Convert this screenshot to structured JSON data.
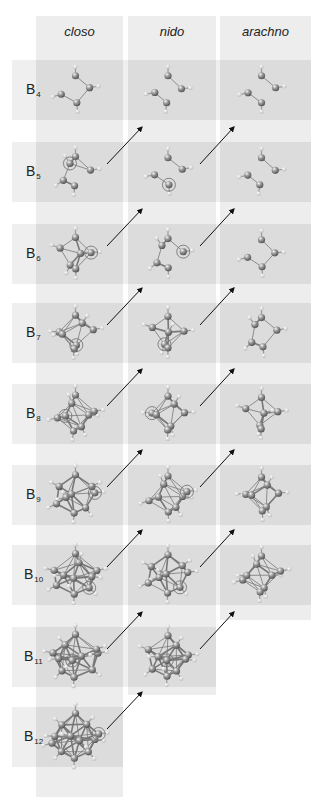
{
  "diagram": {
    "columns": [
      {
        "id": "closo",
        "label": "closo",
        "x": 36,
        "width": 87,
        "bottom": 797
      },
      {
        "id": "nido",
        "label": "nido",
        "x": 128,
        "width": 88,
        "bottom": 695
      },
      {
        "id": "arachno",
        "label": "arachno",
        "x": 220,
        "width": 91,
        "bottom": 620
      }
    ],
    "rows": [
      {
        "element": "B",
        "n": "4",
        "y": 60,
        "cells": [
          "closo",
          "nido",
          "arachno"
        ]
      },
      {
        "element": "B",
        "n": "5",
        "y": 142,
        "cells": [
          "closo",
          "nido",
          "arachno"
        ]
      },
      {
        "element": "B",
        "n": "6",
        "y": 224,
        "cells": [
          "closo",
          "nido",
          "arachno"
        ]
      },
      {
        "element": "B",
        "n": "7",
        "y": 303,
        "cells": [
          "closo",
          "nido",
          "arachno"
        ]
      },
      {
        "element": "B",
        "n": "8",
        "y": 384,
        "cells": [
          "closo",
          "nido",
          "arachno"
        ]
      },
      {
        "element": "B",
        "n": "9",
        "y": 465,
        "cells": [
          "closo",
          "nido",
          "arachno"
        ]
      },
      {
        "element": "B",
        "n": "10",
        "y": 545,
        "cells": [
          "closo",
          "nido",
          "arachno"
        ]
      },
      {
        "element": "B",
        "n": "11",
        "y": 627,
        "cells": [
          "closo",
          "nido"
        ]
      },
      {
        "element": "B",
        "n": "12",
        "y": 707,
        "cells": [
          "closo"
        ]
      }
    ],
    "arrows_description": "Diagonal arrows from each closo/nido cluster up-right to the next column one row above (removal of a vertex)",
    "colors": {
      "column_bg": "#ededed",
      "row_band_bg": "#efefef",
      "cell_bg": "#dcdcdc",
      "boron_atom": "#8a8a8a",
      "hydrogen_atom": "#f5f5f5",
      "bond": "#777777",
      "arrow": "#111111",
      "text": "#222222"
    }
  }
}
